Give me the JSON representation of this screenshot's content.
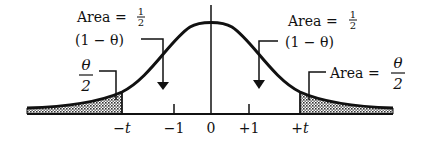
{
  "figure": {
    "type": "normal-distribution-two-tailed",
    "axis_ticks": [
      {
        "label": "−t",
        "x": 122
      },
      {
        "label": "−1",
        "x": 174
      },
      {
        "label": "0",
        "x": 211
      },
      {
        "label": "+1",
        "x": 249
      },
      {
        "label": "+t",
        "x": 300
      }
    ],
    "annotations": {
      "left_center": {
        "prefix": "Area = ",
        "num": "1",
        "den": "2",
        "line2": "(1 − θ)"
      },
      "right_center": {
        "prefix": "Area = ",
        "num": "1",
        "den": "2",
        "line2": "(1 − θ)"
      },
      "left_tail": {
        "prefix": "",
        "num": "θ",
        "den": "2"
      },
      "right_tail": {
        "prefix": "Area = ",
        "num": "θ",
        "den": "2"
      }
    },
    "colors": {
      "ink": "#111111",
      "shade": "#9a9a9a",
      "background": "#ffffff"
    }
  }
}
